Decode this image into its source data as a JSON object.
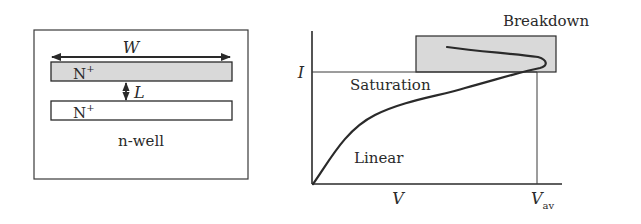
{
  "layout_panel": {
    "width_label": "W",
    "length_label": "L",
    "top_diffusion_label": "N",
    "top_diffusion_sup": "+",
    "bottom_diffusion_label": "N",
    "bottom_diffusion_sup": "+",
    "well_label": "n-well"
  },
  "iv_panel": {
    "y_axis_label": "I",
    "x_axis_label": "V",
    "x_breakdown_label": "V",
    "x_breakdown_sub": "av",
    "region_saturation": "Saturation",
    "region_linear": "Linear",
    "region_breakdown": "Breakdown"
  },
  "colors": {
    "stroke": "#2a2a2a",
    "shaded": "#d9d9d9",
    "background": "#ffffff"
  }
}
